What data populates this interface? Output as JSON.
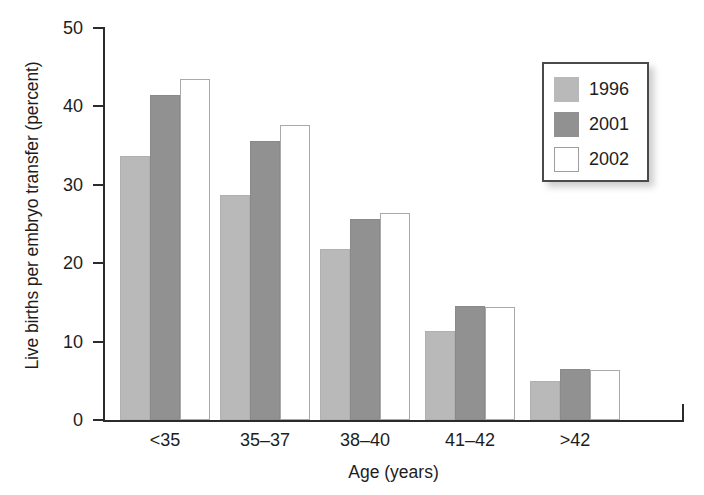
{
  "chart_data": {
    "type": "bar",
    "title": "",
    "xlabel": "Age (years)",
    "ylabel": "Live births per embryo transfer (percent)",
    "categories": [
      "<35",
      "35–37",
      "38–40",
      "41–42",
      ">42"
    ],
    "series": [
      {
        "name": "1996",
        "color": "#b9b9b9",
        "values": [
          33.7,
          28.7,
          21.8,
          11.3,
          5.0
        ]
      },
      {
        "name": "2001",
        "color": "#919191",
        "values": [
          41.4,
          35.6,
          25.6,
          14.5,
          6.5
        ]
      },
      {
        "name": "2002",
        "color": "#ffffff",
        "values": [
          43.5,
          37.6,
          26.4,
          14.4,
          6.4
        ]
      }
    ],
    "ylim": [
      0,
      50
    ],
    "yticks": [
      0,
      10,
      20,
      30,
      40,
      50
    ],
    "ytick_labels": [
      "0",
      "10",
      "20",
      "30",
      "40",
      "50"
    ],
    "grid": false,
    "legend_position": "top-right",
    "legend_entries": [
      "1996",
      "2001",
      "2002"
    ]
  }
}
